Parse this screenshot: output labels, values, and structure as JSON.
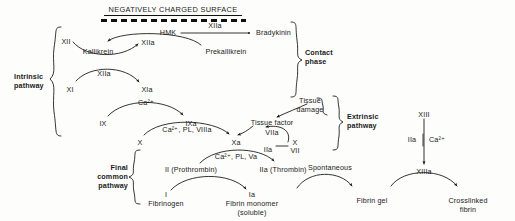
{
  "diagram": {
    "surface_label": "NEGATIVELY CHARGED SURFACE",
    "brace_labels": {
      "intrinsic": "Intrinsic\npathway",
      "contact": "Contact\nphase",
      "extrinsic": "Extrinsic\npathway",
      "final_common": "Final\ncommon\npathway"
    },
    "nodes": {
      "hmk": "HMK",
      "bradykinin": "Bradykinin",
      "xii": "XII",
      "xiia_contact": "XIIa",
      "kallikrein": "Kallikrein",
      "prekallikrein": "Prekallikrein",
      "xi": "XI",
      "xia": "XIa",
      "ix": "IX",
      "ixa": "IXa",
      "x_intrinsic": "X",
      "xa": "Xa",
      "tissue_damage": "Tissue\ndamage",
      "tissue_factor": "Tissue factor",
      "viia": "VIIa",
      "vii": "VII",
      "prothrombin": "II (Prothrombin)",
      "thrombin": "IIa (Thrombin)",
      "fibrinogen": "I\nFibrinogen",
      "fibrin_monomer": "Ia\nFibrin monomer\n(soluble)",
      "fibrin_gel": "Fibrin gel",
      "crosslinked_fibrin": "Crosslinked\nfibrin",
      "xiii": "XIII",
      "xiiia": "XIIIa"
    },
    "edge_labels": {
      "hmk_to_bradykinin": "XIIa",
      "xii_to_xiia": "XIIa",
      "ix_to_ixa": "Ca²⁺",
      "x_to_xa": "Ca²⁺, PL, VIIIa",
      "prothrombin_to_thrombin": "Ca²⁺, PL, Va",
      "viia_feedback": "IIa",
      "viia_x_label": "X",
      "fibrin_to_gel": "Spontaneous",
      "xiii_left": "IIa",
      "xiii_right": "Ca²⁺"
    },
    "colors": {
      "ink": "#1a1a1a",
      "stroke": "#111111",
      "background": "#fdfdfb"
    }
  }
}
